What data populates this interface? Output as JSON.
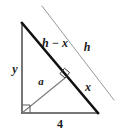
{
  "figure": {
    "type": "geometry-diagram",
    "background_color": "#ffffff",
    "stroke_color_dark": "#1a1a1a",
    "stroke_color_light": "#8c8c8c",
    "labels": {
      "hypotenuse_upper": "h − x",
      "parallel_line": "h",
      "vertical_leg": "y",
      "altitude": "a",
      "hypotenuse_lower": "x",
      "base": "4"
    },
    "geometry": {
      "vertex_top": {
        "x": 22,
        "y": 23
      },
      "vertex_bottom_left": {
        "x": 22,
        "y": 113
      },
      "vertex_bottom_right": {
        "x": 98,
        "y": 113
      },
      "foot_on_hypotenuse": {
        "x": 65,
        "y": 78
      },
      "parallel_line_start": {
        "x": 42,
        "y": 6
      },
      "parallel_line_end": {
        "x": 114,
        "y": 100
      }
    },
    "label_positions": {
      "hypotenuse_upper": {
        "x": 55,
        "y": 44
      },
      "parallel_line": {
        "x": 87,
        "y": 48
      },
      "vertical_leg": {
        "x": 15,
        "y": 70
      },
      "altitude": {
        "x": 41,
        "y": 82
      },
      "hypotenuse_lower": {
        "x": 88,
        "y": 88
      },
      "base": {
        "x": 60,
        "y": 125
      }
    },
    "right_angle_markers": [
      {
        "name": "right-angle-bottom-left",
        "x": 22,
        "y": 113
      },
      {
        "name": "right-angle-altitude-foot",
        "x": 65,
        "y": 78
      }
    ]
  }
}
